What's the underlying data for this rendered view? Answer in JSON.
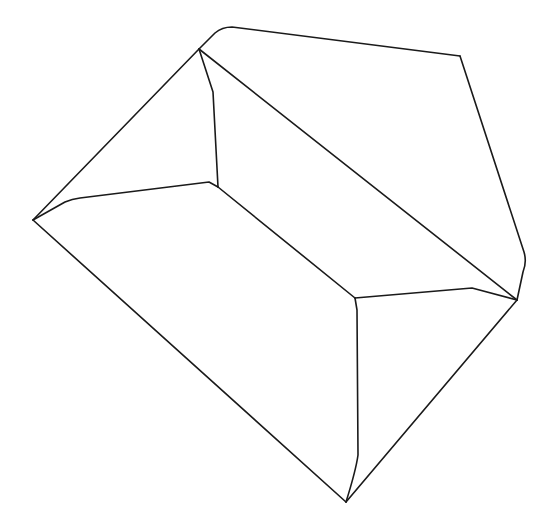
{
  "diagram": {
    "type": "line-drawing",
    "stroke_color": "#1a1a1a",
    "background": "#ffffff",
    "stroke_width": 1.6,
    "paths": [
      {
        "name": "outer-left-top-edge",
        "d": "M33,220 L199,49"
      },
      {
        "name": "top-rounded-edge",
        "d": "M199,49 L215,33 Q222,27 232,27 L460,56"
      },
      {
        "name": "outer-right-edge",
        "d": "M460,56 L524,252 Q527,262 523,272 L517,300"
      },
      {
        "name": "outer-bottom-right-edge",
        "d": "M517,300 L346,502"
      },
      {
        "name": "outer-bottom-left-edge",
        "d": "M33,220 L346,502"
      },
      {
        "name": "inner-top-vertical-edge",
        "d": "M199,49 L213,92 L218,187"
      },
      {
        "name": "inner-main-diagonal",
        "d": "M199,49 L517,300"
      },
      {
        "name": "inner-left-ridge",
        "d": "M33,220 L65,202 Q72,199 80,198 L209,182 L218,187"
      },
      {
        "name": "inner-center-diagonal",
        "d": "M218,187 L355,298"
      },
      {
        "name": "inner-right-ridge",
        "d": "M355,298 L472,288 L517,300"
      },
      {
        "name": "inner-bottom-vertical-edge",
        "d": "M355,298 L357,310 L358,455 Q356,470 346,502"
      }
    ]
  }
}
